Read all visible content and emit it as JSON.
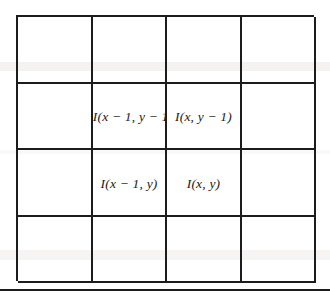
{
  "figure": {
    "background_color": "#ffffff",
    "line_color": "#1c1c1c",
    "text_color": "#1a1a1a",
    "grid": {
      "columns": 4,
      "rows": 4,
      "cells": [
        [
          {
            "label": "",
            "clipped": false
          },
          {
            "label": "",
            "clipped": false
          },
          {
            "label": "",
            "clipped": false
          },
          {
            "label": "",
            "clipped": false
          }
        ],
        [
          {
            "label": "",
            "clipped": false
          },
          {
            "label": "I(x − 1, y − 1)",
            "clipped": true
          },
          {
            "label": "I(x, y − 1)",
            "clipped": false
          },
          {
            "label": "",
            "clipped": false
          }
        ],
        [
          {
            "label": "",
            "clipped": false
          },
          {
            "label": "I(x − 1, y)",
            "clipped": false
          },
          {
            "label": "I(x, y)",
            "clipped": false
          },
          {
            "label": "",
            "clipped": false
          }
        ],
        [
          {
            "label": "",
            "clipped": false
          },
          {
            "label": "",
            "clipped": false
          },
          {
            "label": "",
            "clipped": false
          },
          {
            "label": "",
            "clipped": false
          }
        ]
      ]
    }
  }
}
